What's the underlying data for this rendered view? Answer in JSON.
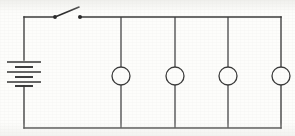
{
  "figure": {
    "background_color": "#fdfdfb",
    "line_color": "#3a3a3a",
    "width": 295,
    "height": 136
  },
  "layout": {
    "left_rail_x": 24,
    "right_rail_x": 281,
    "top_rail_y": 17,
    "bottom_rail_y": 128
  },
  "battery": {
    "name": "battery",
    "symbol": "multi-cell-battery",
    "cells": 3,
    "center_x": 24,
    "top_y": 60,
    "bottom_y": 86,
    "plates": [
      {
        "type": "long",
        "y": 62,
        "half_width": 17
      },
      {
        "type": "short",
        "y": 67,
        "half_width": 9
      },
      {
        "type": "long",
        "y": 72,
        "half_width": 17
      },
      {
        "type": "short",
        "y": 77,
        "half_width": 9
      },
      {
        "type": "long",
        "y": 82,
        "half_width": 17
      },
      {
        "type": "short",
        "y": 86,
        "half_width": 9
      }
    ]
  },
  "switch": {
    "name": "knife-switch",
    "state": "open",
    "pivot_x": 55,
    "contact_x": 80,
    "rail_y": 17,
    "blade_tip_x": 79,
    "blade_tip_y": 7
  },
  "lamps": [
    {
      "name": "lamp-1",
      "symbol": "circle",
      "center_x": 121,
      "center_y": 76,
      "radius": 9
    },
    {
      "name": "lamp-2",
      "symbol": "circle",
      "center_x": 175,
      "center_y": 76,
      "radius": 9
    },
    {
      "name": "lamp-3",
      "symbol": "circle",
      "center_x": 228,
      "center_y": 76,
      "radius": 9
    },
    {
      "name": "lamp-4",
      "symbol": "circle",
      "center_x": 281,
      "center_y": 76,
      "radius": 9
    }
  ],
  "labels": {
    "visible_text": []
  }
}
